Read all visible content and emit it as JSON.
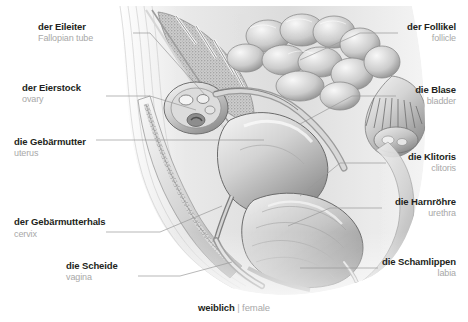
{
  "figure": {
    "title_de": "weiblich",
    "separator": "|",
    "title_en": "female",
    "style": "grayscale medical illustration"
  },
  "colors": {
    "background": "#ffffff",
    "german_text": "#231f20",
    "english_text": "#a8a8a8",
    "leader_line": "#9a9a9a",
    "illustration_light": "#f2f2f2",
    "illustration_mid": "#bdbdbd",
    "illustration_dark": "#5a5a5a"
  },
  "labels": [
    {
      "id": "fallopian-tube",
      "de": "der Eileiter",
      "en": "Fallopian tube",
      "side": "left",
      "x": 38,
      "y": 22
    },
    {
      "id": "ovary",
      "de": "der Eierstock",
      "en": "ovary",
      "side": "left",
      "x": 22,
      "y": 83
    },
    {
      "id": "uterus",
      "de": "die Gebärmutter",
      "en": "uterus",
      "side": "left",
      "x": 14,
      "y": 137
    },
    {
      "id": "cervix",
      "de": "der Gebärmutterhals",
      "en": "cervix",
      "side": "left",
      "x": 14,
      "y": 216
    },
    {
      "id": "vagina",
      "de": "die Scheide",
      "en": "vagina",
      "side": "left",
      "x": 66,
      "y": 261
    },
    {
      "id": "follicle",
      "de": "der Follikel",
      "en": "follicle",
      "side": "right",
      "x": 404,
      "y": 22
    },
    {
      "id": "bladder",
      "de": "die Blase",
      "en": "bladder",
      "side": "right",
      "x": 399,
      "y": 85
    },
    {
      "id": "clitoris",
      "de": "die Klitoris",
      "en": "clitoris",
      "side": "right",
      "x": 392,
      "y": 152
    },
    {
      "id": "urethra",
      "de": "die Harnröhre",
      "en": "urethra",
      "side": "right",
      "x": 388,
      "y": 197
    },
    {
      "id": "labia",
      "de": "die Schamlippen",
      "en": "labia",
      "side": "right",
      "x": 383,
      "y": 257
    }
  ],
  "leader_lines": [
    {
      "id": "leader-fallopian-tube",
      "from": "der Eileiter",
      "to": "fallopian tube region"
    },
    {
      "id": "leader-ovary",
      "from": "der Eierstock",
      "to": "ovary region"
    },
    {
      "id": "leader-uterus",
      "from": "die Gebärmutter",
      "to": "uterus region"
    },
    {
      "id": "leader-cervix",
      "from": "der Gebärmutterhals",
      "to": "cervix region"
    },
    {
      "id": "leader-vagina",
      "from": "die Scheide",
      "to": "vagina region"
    },
    {
      "id": "leader-follicle",
      "from": "der Follikel",
      "to": "follicle region"
    },
    {
      "id": "leader-bladder",
      "from": "die Blase",
      "to": "bladder region"
    },
    {
      "id": "leader-clitoris",
      "from": "die Klitoris",
      "to": "clitoris region"
    },
    {
      "id": "leader-urethra",
      "from": "die Harnröhre",
      "to": "urethra region"
    },
    {
      "id": "leader-labia",
      "from": "die Schamlippen",
      "to": "labia region"
    }
  ]
}
